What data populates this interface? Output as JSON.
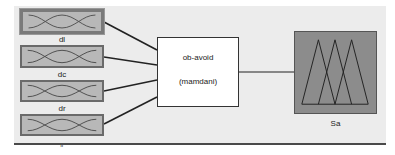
{
  "system": {
    "name": "ob-avoid",
    "type": "(mamdani)"
  },
  "inputs": [
    {
      "label": "",
      "selected": true
    },
    {
      "label": "dl",
      "selected": false
    },
    {
      "label": "dc",
      "selected": false
    },
    {
      "label": "dr",
      "selected": false
    },
    {
      "label": "fr",
      "selected": false
    }
  ],
  "output": {
    "label": "Sa"
  },
  "colors": {
    "canvas_bg": "#ececec",
    "variable_fill": "#b8b8b8",
    "output_fill": "#8c8c8c",
    "line": "#333333"
  }
}
